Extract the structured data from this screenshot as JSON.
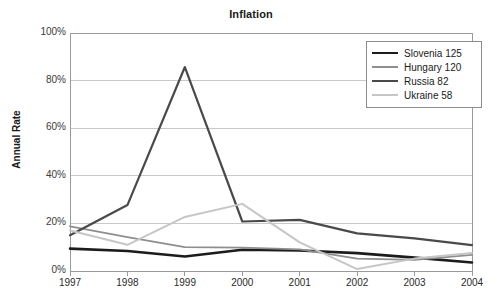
{
  "chart_data": {
    "type": "line",
    "title": "Inflation",
    "xlabel": "",
    "ylabel": "Annual Rate",
    "x": [
      1997,
      1998,
      1999,
      2000,
      2001,
      2002,
      2003,
      2004
    ],
    "categories": [
      "1997",
      "1998",
      "1999",
      "2000",
      "2001",
      "2002",
      "2003",
      "2004"
    ],
    "xlim": [
      1997,
      2004
    ],
    "ylim": [
      0,
      100
    ],
    "yticks": [
      0,
      20,
      40,
      60,
      80,
      100
    ],
    "ytick_labels": [
      "0%",
      "20%",
      "40%",
      "60%",
      "80%",
      "100%"
    ],
    "grid": "horizontal",
    "legend_position": "top-right",
    "series": [
      {
        "name": "Slovenia 125",
        "label": "Slovenia 125",
        "color": "#1c1c1c",
        "width": 2.6,
        "values": [
          9.4,
          8.4,
          6.1,
          8.9,
          8.6,
          7.5,
          5.6,
          3.6
        ]
      },
      {
        "name": "Hungary 120",
        "label": "Hungary 120",
        "color": "#8e8e8e",
        "width": 1.8,
        "values": [
          18.8,
          14.2,
          10.0,
          9.8,
          9.1,
          5.2,
          4.7,
          6.8
        ]
      },
      {
        "name": "Russia 82",
        "label": "Russia 82",
        "color": "#4a4a4a",
        "width": 2.2,
        "values": [
          15.0,
          27.7,
          85.7,
          20.8,
          21.5,
          15.8,
          13.7,
          10.9
        ]
      },
      {
        "name": "Ukraine 58",
        "label": "Ukraine 58",
        "color": "#c6c6c6",
        "width": 2.0,
        "values": [
          17.0,
          11.0,
          22.7,
          28.2,
          12.0,
          0.8,
          5.2,
          7.6
        ]
      }
    ]
  }
}
